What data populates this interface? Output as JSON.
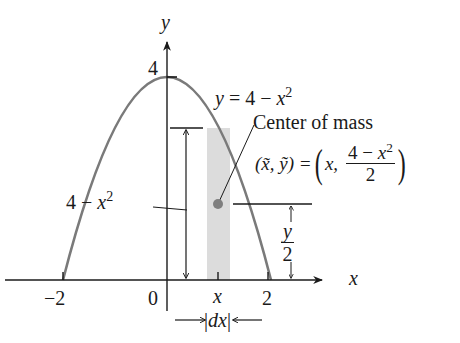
{
  "figure": {
    "curve_label": {
      "lhs": "y",
      "eq": " = 4 − ",
      "var": "x",
      "exp": "2"
    },
    "center_of_mass_label": "Center of mass",
    "centroid_formula": {
      "lhs": "(x̃, ỹ) = ",
      "x_comp": "x,",
      "num_prefix": "4 − ",
      "num_var": "x",
      "num_exp": "2",
      "den": "2"
    },
    "height_label": {
      "prefix": "4 − ",
      "var": "x",
      "exp": "2"
    },
    "half_height_label": {
      "num": "y",
      "den": "2"
    },
    "strip_width_label": {
      "bar_left": "|",
      "var": "dx",
      "bar_right": "|"
    },
    "axes": {
      "x_axis_label": "x",
      "y_axis_label": "y",
      "x_ticks": [
        "−2",
        "0",
        "x",
        "2"
      ],
      "y_ticks": [
        "4"
      ]
    },
    "colors": {
      "curve": "#7a7a7a",
      "strip": "#dcdcdc",
      "centroid_dot": "#7f7f7f",
      "ink": "#1a1a1a"
    }
  }
}
